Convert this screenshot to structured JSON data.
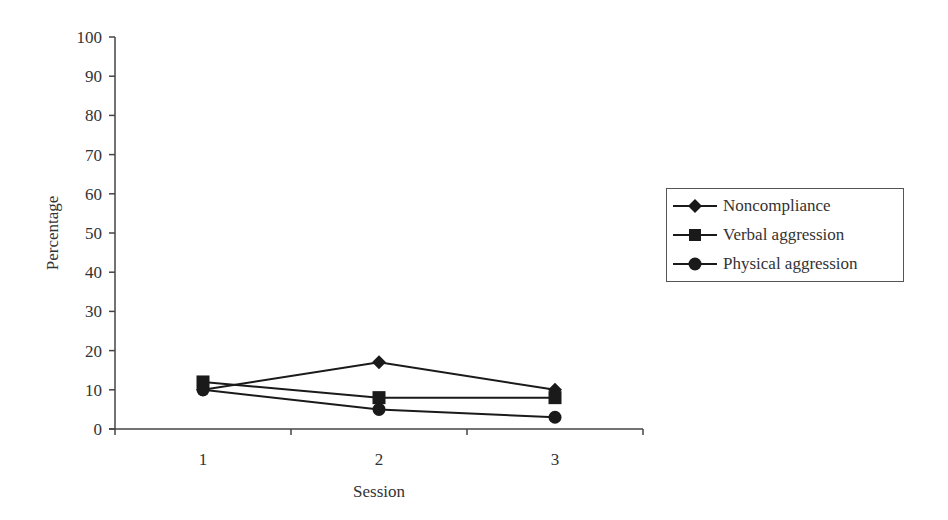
{
  "chart_data": {
    "type": "line",
    "title": "",
    "xlabel": "Session",
    "ylabel": "Percentage",
    "categories": [
      "1",
      "2",
      "3"
    ],
    "ylim": [
      0,
      100
    ],
    "yticks": [
      0,
      10,
      20,
      30,
      40,
      50,
      60,
      70,
      80,
      90,
      100
    ],
    "grid": false,
    "legend_position": "right",
    "series": [
      {
        "name": "Noncompliance",
        "marker": "diamond",
        "values": [
          10,
          17,
          10
        ]
      },
      {
        "name": "Verbal aggression",
        "marker": "square",
        "values": [
          12,
          8,
          8
        ]
      },
      {
        "name": "Physical aggression",
        "marker": "circle",
        "values": [
          10,
          5,
          3
        ]
      }
    ]
  },
  "colors": {
    "line": "#1a1a1a",
    "axis": "#444444",
    "text": "#333333"
  }
}
